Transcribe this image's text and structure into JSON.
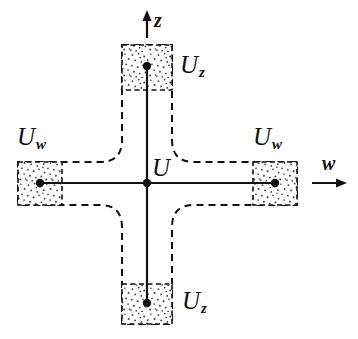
{
  "figure": {
    "type": "mathematical-diagram",
    "width": 358,
    "height": 339,
    "background_color": "#ffffff",
    "ink_color": "#111111"
  },
  "labels": {
    "center": {
      "base": "U",
      "sub": ""
    },
    "top": {
      "base": "U",
      "sub": "z"
    },
    "bottom": {
      "base": "U",
      "sub": "z"
    },
    "left": {
      "base": "U",
      "sub": "w"
    },
    "right": {
      "base": "U",
      "sub": "w"
    }
  },
  "axes": {
    "vertical": {
      "label": "z",
      "direction": "up"
    },
    "horizontal": {
      "label": "w",
      "direction": "right"
    }
  },
  "geometry": {
    "center_point": {
      "x": 147,
      "y": 183
    },
    "nodes": [
      {
        "name": "center",
        "x": 147,
        "y": 183
      },
      {
        "name": "top",
        "x": 147,
        "y": 66
      },
      {
        "name": "bottom",
        "x": 147,
        "y": 303
      },
      {
        "name": "left",
        "x": 40,
        "y": 183
      },
      {
        "name": "right",
        "x": 275,
        "y": 183
      }
    ],
    "stipple_boxes": [
      {
        "name": "top",
        "x": 122,
        "y": 45,
        "width": 50,
        "height": 45
      },
      {
        "name": "bottom",
        "x": 122,
        "y": 284,
        "width": 50,
        "height": 40
      },
      {
        "name": "left",
        "x": 18,
        "y": 162,
        "width": 44,
        "height": 43
      },
      {
        "name": "right",
        "x": 253,
        "y": 162,
        "width": 44,
        "height": 43
      }
    ],
    "cross_outline": {
      "style": "dashed",
      "corner_radius": 22,
      "vertical_arm_x": [
        122,
        172
      ],
      "horizontal_arm_y": [
        162,
        205
      ],
      "top": 45,
      "bottom": 324,
      "left": 18,
      "right": 297
    }
  },
  "colors": {
    "ink": "#111111",
    "stipple": "#3a3a3a",
    "background": "#ffffff"
  }
}
